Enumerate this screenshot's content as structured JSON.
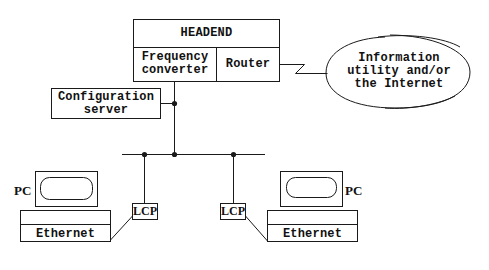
{
  "diagram": {
    "type": "network-topology",
    "colors": {
      "line": "#1a1a1a",
      "background": "#ffffff"
    },
    "nodes": {
      "headend": {
        "title": "HEADEND",
        "frequency_converter": {
          "line1": "Frequency",
          "line2": "converter"
        },
        "router": "Router"
      },
      "internet": {
        "line1": "Information",
        "line2": "utility and/or",
        "line3": "the Internet"
      },
      "config_server": {
        "line1": "Configuration",
        "line2": "server"
      },
      "left_pc": {
        "label": "PC",
        "nic": "Ethernet"
      },
      "right_pc": {
        "label": "PC",
        "nic": "Ethernet"
      },
      "left_lcp": "LCP",
      "right_lcp": "LCP"
    },
    "edges": [
      {
        "from": "router",
        "to": "internet",
        "style": "lightning"
      },
      {
        "from": "headend",
        "to": "bus"
      },
      {
        "from": "config_server",
        "to": "headend-bus-line"
      },
      {
        "from": "bus",
        "to": "left_lcp"
      },
      {
        "from": "bus",
        "to": "right_lcp"
      },
      {
        "from": "left_lcp",
        "to": "left_pc.ethernet"
      },
      {
        "from": "right_lcp",
        "to": "right_pc.ethernet"
      }
    ]
  }
}
